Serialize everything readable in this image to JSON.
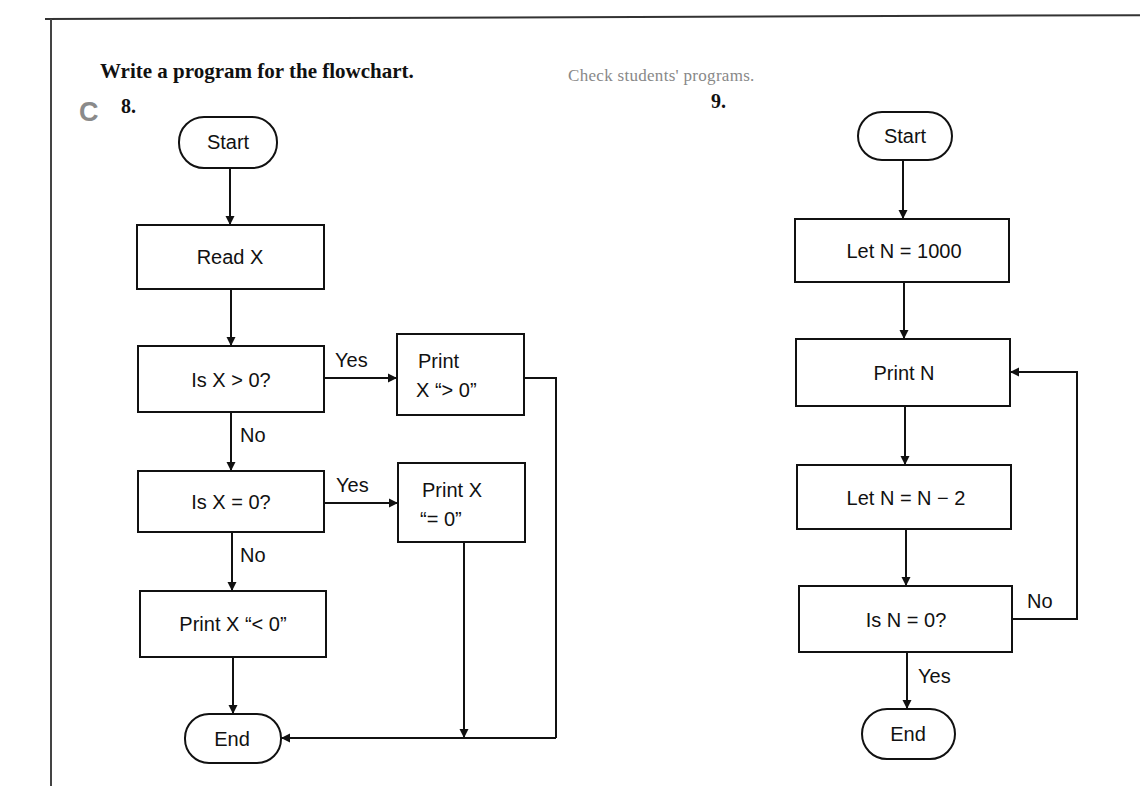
{
  "header": {
    "instruction": "Write a program for the flowchart.",
    "answer_note": "Check students' programs.",
    "level_letter": "C"
  },
  "problems": [
    {
      "number": "8.",
      "flowchart": {
        "nodes": {
          "start": "Start",
          "read": "Read X",
          "decision1": "Is X > 0?",
          "print_pos_line1": "Print",
          "print_pos_line2": "X “> 0”",
          "decision2": "Is X = 0?",
          "print_zero_line1": "Print X",
          "print_zero_line2": "“= 0”",
          "print_neg": "Print X “< 0”",
          "end": "End"
        },
        "edge_labels": {
          "d1_yes": "Yes",
          "d1_no": "No",
          "d2_yes": "Yes",
          "d2_no": "No"
        }
      }
    },
    {
      "number": "9.",
      "flowchart": {
        "nodes": {
          "start": "Start",
          "init": "Let N = 1000",
          "print": "Print N",
          "decrement": "Let N = N − 2",
          "decision": "Is N = 0?",
          "end": "End"
        },
        "edge_labels": {
          "no": "No",
          "yes": "Yes"
        }
      }
    }
  ],
  "colors": {
    "ink": "#111111",
    "gray_text": "#888888",
    "background": "#ffffff"
  }
}
